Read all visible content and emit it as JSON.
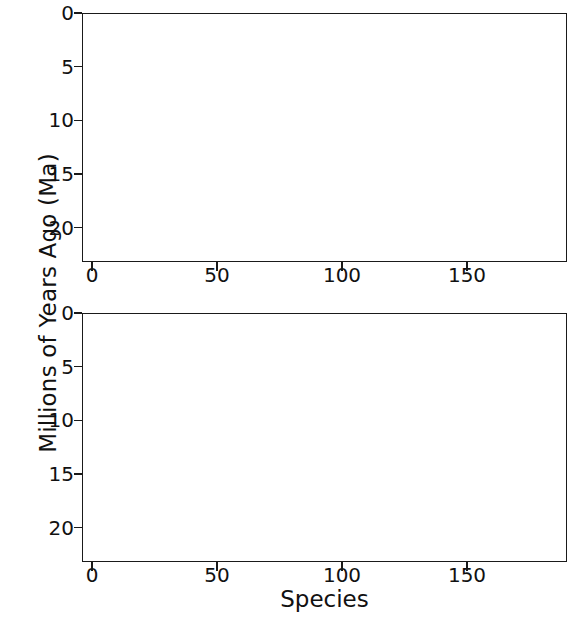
{
  "chart_data": [
    {
      "panel": "top",
      "type": "bar",
      "title": "",
      "xlabel": "",
      "ylabel": "Millions of Years Ago (Ma)",
      "xlim": [
        -4,
        190
      ],
      "ylim": [
        0,
        23.2
      ],
      "y_inverted": true,
      "yticks": [
        0,
        5,
        10,
        15,
        20
      ],
      "ytick_labels": [
        "0",
        "5",
        "10",
        "15",
        "20"
      ],
      "xticks": [
        0,
        50,
        100,
        150
      ],
      "xtick_labels": [
        "0",
        "50",
        "100",
        "150"
      ],
      "grid": "faint-horizontal",
      "bar_color": "#1b1b1b",
      "series_name": "species age range (top to bottom of bar)",
      "n_bars": 186,
      "note": "Each bar spans from its origination age (bottom) up to its younger limit (top); bars reaching the panel floor are off-scale older than 23 Ma.",
      "bars_top": [
        2.0,
        2.0,
        2.0,
        1.8,
        1.6,
        1.6,
        1.4,
        1.4,
        1.2,
        0.9,
        0.6,
        0.0,
        0.0,
        0.0,
        0.0,
        0.0,
        0.0,
        0.0,
        0.0,
        0.0,
        0.0,
        0.0,
        0.0,
        0.0,
        0.0,
        0.0,
        0.0,
        0.0,
        0.0,
        0.0,
        0.0,
        0.0,
        0.0,
        0.0,
        0.0,
        0.0,
        0.0,
        0.0,
        0.0,
        0.0,
        0.0,
        0.0,
        0.0,
        0.0,
        0.0,
        0.0,
        0.0,
        0.0,
        0.0,
        0.0,
        0.0,
        0.0,
        0.0,
        0.0,
        0.0,
        0.0,
        0.0,
        0.0,
        0.0,
        0.0,
        0.0,
        0.0,
        0.0,
        0.0,
        0.0,
        0.0,
        0.0,
        0.0,
        0.0,
        0.0,
        0.0,
        0.0,
        0.0,
        0.0,
        0.0,
        0.0,
        0.0,
        0.0,
        0.0,
        0.0,
        0.0,
        0.0,
        0.0,
        0.0,
        0.0,
        0.0,
        0.0,
        0.0,
        0.0,
        0.0,
        0.0,
        0.0,
        0.0,
        0.0,
        0.0,
        0.0,
        0.0,
        0.0,
        0.0,
        0.0,
        0.0,
        0.0,
        0.0,
        0.0,
        0.0,
        0.0,
        0.0,
        0.0,
        0.0,
        0.0,
        0.0,
        0.0,
        0.0,
        0.0,
        0.0,
        0.0,
        0.0,
        0.0,
        0.0,
        0.0,
        0.0,
        0.0,
        0.0,
        0.0,
        0.0,
        0.0,
        0.0,
        0.0,
        0.0,
        0.0,
        0.0,
        0.0,
        0.0,
        0.0,
        0.0,
        0.0,
        0.0,
        0.0,
        0.0,
        0.0,
        0.0,
        0.0,
        0.0,
        0.0,
        0.0,
        0.0,
        0.0,
        0.0,
        0.0,
        0.0,
        0.0,
        0.0,
        0.0,
        0.0,
        0.0,
        0.0,
        0.0,
        0.0,
        0.0,
        0.0,
        0.0,
        0.0,
        0.0,
        0.0,
        0.0,
        0.0,
        0.0,
        0.0,
        0.0,
        0.0,
        0.0,
        0.0,
        0.0,
        0.0,
        0.0,
        0.0,
        0.0,
        0.0,
        0.0,
        0.0,
        0.0,
        0.0,
        0.0
      ],
      "bars_bottom": [
        23.2,
        23.2,
        23.2,
        23.2,
        23.2,
        23.2,
        23.2,
        23.2,
        23.2,
        23.2,
        23.2,
        23.2,
        13.0,
        17.3,
        17.3,
        17.3,
        17.3,
        17.3,
        17.3,
        17.3,
        17.3,
        17.3,
        17.3,
        17.3,
        15.0,
        15.0,
        15.0,
        15.0,
        15.0,
        16.2,
        16.2,
        16.2,
        16.2,
        16.2,
        16.2,
        16.2,
        16.2,
        16.2,
        16.2,
        16.2,
        16.2,
        16.2,
        16.2,
        16.2,
        16.2,
        16.2,
        16.2,
        16.2,
        16.2,
        16.2,
        16.2,
        16.2,
        16.2,
        16.2,
        16.2,
        11.2,
        11.2,
        14.8,
        10.4,
        8.2,
        8.2,
        8.2,
        8.2,
        8.2,
        8.2,
        8.2,
        8.2,
        8.2,
        8.2,
        8.2,
        8.2,
        8.2,
        8.2,
        8.2,
        8.2,
        8.2,
        7.6,
        7.6,
        7.6,
        7.6,
        7.6,
        7.6,
        7.6,
        7.6,
        7.6,
        7.6,
        7.6,
        7.6,
        7.6,
        7.6,
        7.6,
        7.6,
        7.6,
        7.6,
        7.6,
        7.6,
        7.6,
        7.6,
        7.6,
        7.6,
        7.6,
        7.6,
        7.6,
        7.6,
        7.6,
        7.6,
        7.6,
        7.6,
        7.6,
        7.6,
        7.6,
        7.6,
        7.6,
        7.6,
        7.6,
        7.6,
        7.6,
        5.6,
        5.6,
        5.6,
        5.6,
        5.6,
        5.6,
        5.6,
        5.6,
        5.6,
        5.6,
        5.6,
        5.6,
        5.6,
        5.6,
        5.6,
        5.6,
        5.6,
        5.6,
        5.6,
        5.6,
        5.6,
        5.6,
        5.6,
        5.6,
        5.6,
        5.6,
        5.6,
        5.6,
        5.6,
        4.4,
        4.4,
        4.4,
        3.6,
        3.6,
        3.4,
        3.4,
        3.3,
        3.2,
        3.0,
        3.0,
        2.9,
        2.8,
        2.7,
        2.6,
        2.5,
        2.4,
        2.4,
        2.3,
        2.2,
        2.1,
        2.0,
        1.9,
        1.8,
        1.7,
        1.6,
        1.5,
        1.4,
        1.3,
        1.2,
        1.1,
        1.0,
        0.9,
        0.8,
        0.7,
        0.6,
        0.55,
        0.5,
        0.45,
        0.4,
        0.35,
        0.3,
        0.28,
        0.25,
        0.22,
        0.2,
        0.18,
        0.15,
        0.12,
        0.1,
        0.08,
        0.06,
        0.05
      ]
    },
    {
      "panel": "bottom",
      "type": "bar",
      "title": "",
      "xlabel": "Species",
      "ylabel": "Millions of Years Ago (Ma)",
      "xlim": [
        -4,
        190
      ],
      "ylim": [
        0,
        23.2
      ],
      "y_inverted": true,
      "yticks": [
        0,
        5,
        10,
        15,
        20
      ],
      "ytick_labels": [
        "0",
        "5",
        "10",
        "15",
        "20"
      ],
      "xticks": [
        0,
        50,
        100,
        150
      ],
      "xtick_labels": [
        "0",
        "50",
        "100",
        "150"
      ],
      "grid": "faint-horizontal",
      "bar_color": "#1b1b1b",
      "series_name": "species age range (top to bottom of bar)",
      "n_bars": 186,
      "note": "Lower panel of the same figure; several bars run off the bottom of the axis (older than 23 Ma).",
      "bars_top": [
        15.0,
        15.0,
        15.0,
        14.8,
        14.8,
        14.8,
        14.8,
        14.6,
        13.0,
        13.0,
        11.0,
        11.0,
        11.0,
        11.0,
        5.5,
        4.5,
        4.5,
        4.4,
        4.4,
        4.4,
        4.4,
        4.4,
        4.4,
        4.4,
        4.4,
        4.4,
        4.4,
        4.4,
        4.4,
        4.4,
        3.6,
        3.5,
        3.4,
        3.3,
        3.2,
        3.2,
        3.2,
        3.2,
        3.2,
        3.2,
        3.1,
        3.0,
        3.0,
        3.0,
        3.0,
        3.0,
        2.9,
        2.9,
        2.8,
        2.8,
        2.8,
        2.7,
        2.6,
        1.8,
        1.8,
        1.8,
        1.8,
        1.8,
        1.8,
        1.8,
        1.8,
        1.8,
        1.8,
        1.8,
        1.8,
        1.8,
        1.8,
        1.8,
        1.8,
        1.8,
        1.8,
        1.8,
        1.8,
        1.8,
        1.8,
        1.8,
        1.8,
        1.8,
        1.8,
        1.8,
        1.8,
        1.8,
        1.8,
        1.8,
        1.8,
        1.8,
        1.8,
        1.3,
        1.3,
        1.3,
        1.3,
        1.3,
        1.3,
        1.3,
        1.3,
        1.3,
        1.3,
        1.3,
        1.3,
        1.3,
        1.3,
        1.3,
        1.3,
        1.3,
        1.3,
        1.3,
        1.3,
        1.3,
        1.3,
        1.3,
        1.3,
        1.3,
        1.3,
        0.9,
        0.9,
        0.9,
        0.9,
        0.9,
        0.0,
        0.0,
        0.0,
        0.0,
        0.0,
        0.0,
        0.0,
        0.0,
        0.0,
        0.0,
        0.0,
        0.0,
        0.0,
        0.0,
        0.0,
        0.0,
        0.0,
        0.0,
        0.0,
        0.0,
        0.0,
        0.0,
        0.0,
        0.0,
        0.0,
        0.0,
        0.0,
        0.0,
        0.0,
        0.0,
        0.0,
        0.0,
        0.0,
        0.0,
        0.0,
        0.0,
        0.0,
        0.0,
        0.0,
        0.0,
        0.0,
        0.0,
        0.0,
        0.0,
        0.0,
        0.0,
        0.0,
        0.0,
        0.0,
        0.0,
        0.0,
        0.0,
        0.0,
        0.0,
        0.0,
        0.0,
        0.0,
        0.0,
        0.0,
        0.0,
        0.0,
        0.0,
        0.0,
        0.0,
        0.0,
        0.0,
        0.0,
        0.0
      ],
      "bars_bottom": [
        15.6,
        15.6,
        15.6,
        15.6,
        15.6,
        15.6,
        15.6,
        15.6,
        17.3,
        17.3,
        16.2,
        16.2,
        16.2,
        16.2,
        8.4,
        7.6,
        7.6,
        17.3,
        17.3,
        7.3,
        7.3,
        7.3,
        7.3,
        7.3,
        7.3,
        16.3,
        16.3,
        7.3,
        7.3,
        7.3,
        7.3,
        7.3,
        7.3,
        7.3,
        9.2,
        9.2,
        16.2,
        7.2,
        7.2,
        7.2,
        7.2,
        7.2,
        17.3,
        7.2,
        7.2,
        7.2,
        7.2,
        7.2,
        7.2,
        7.2,
        7.2,
        16.3,
        16.3,
        23.2,
        16.3,
        16.3,
        10.2,
        10.2,
        7.2,
        7.2,
        7.2,
        7.2,
        7.2,
        7.2,
        7.2,
        7.2,
        7.2,
        7.2,
        23.2,
        8.2,
        8.2,
        23.2,
        8.2,
        8.2,
        8.2,
        8.2,
        8.2,
        8.2,
        8.2,
        8.2,
        8.2,
        8.2,
        8.2,
        7.0,
        7.0,
        7.0,
        7.0,
        7.0,
        17.0,
        7.0,
        7.0,
        7.0,
        23.2,
        23.2,
        14.8,
        14.8,
        9.8,
        9.8,
        9.8,
        8.3,
        8.3,
        8.3,
        8.3,
        8.3,
        8.3,
        7.4,
        7.4,
        7.4,
        7.4,
        7.4,
        7.4,
        7.4,
        7.4,
        7.4,
        7.4,
        16.2,
        16.2,
        16.2,
        23.2,
        7.8,
        7.8,
        7.8,
        7.8,
        7.8,
        7.8,
        7.8,
        7.8,
        23.2,
        17.3,
        17.3,
        16.2,
        10.2,
        10.2,
        9.6,
        9.6,
        9.6,
        9.6,
        9.6,
        9.6,
        8.6,
        8.6,
        8.6,
        8.6,
        7.6,
        7.6,
        7.6,
        7.6,
        7.6,
        7.6,
        7.6,
        7.6,
        7.6,
        7.6,
        7.6,
        5.6,
        5.6,
        5.6,
        5.6,
        5.6,
        5.6,
        5.6,
        5.6,
        5.6,
        4.2,
        4.0,
        3.8,
        3.6,
        3.5,
        3.4,
        3.3,
        3.2,
        3.0,
        2.9,
        2.8,
        2.6,
        2.5,
        2.4,
        2.3,
        2.2,
        2.0,
        1.9,
        1.7,
        1.5,
        1.3,
        1.1,
        0.9,
        0.7,
        0.5,
        0.4,
        0.3,
        0.25,
        0.2,
        0.15,
        0.1,
        0.06
      ]
    }
  ],
  "axes": {
    "ylabel": "Millions of Years Ago (Ma)",
    "xlabel": "Species",
    "ytick_labels": [
      "0",
      "5",
      "10",
      "15",
      "20"
    ],
    "xtick_labels": [
      "0",
      "50",
      "100",
      "150"
    ]
  }
}
